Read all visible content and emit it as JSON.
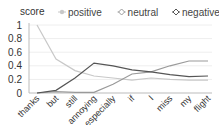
{
  "chart_data": {
    "type": "line",
    "title": "",
    "xlabel": "",
    "ylabel": "score",
    "ylim": [
      0,
      1
    ],
    "yticks": [
      "0",
      "0.2",
      "0.4",
      "0.6",
      "0.8",
      "1"
    ],
    "grid": true,
    "legend_position": "top",
    "categories": [
      "thanks",
      "but",
      "still",
      "annoying",
      "especially",
      "if",
      "I",
      "miss",
      "my",
      "flight"
    ],
    "series": [
      {
        "name": "positive",
        "color": "#c8c8c8",
        "marker": "circle",
        "values": [
          1.0,
          0.5,
          0.33,
          0.25,
          0.22,
          0.19,
          0.22,
          0.2,
          0.19,
          0.19
        ]
      },
      {
        "name": "neutral",
        "color": "#9a9a9a",
        "marker": "diamond",
        "values": [
          0.0,
          0.02,
          0.01,
          0.01,
          0.13,
          0.28,
          0.31,
          0.4,
          0.47,
          0.47
        ]
      },
      {
        "name": "negative",
        "color": "#555555",
        "marker": "diamond",
        "values": [
          0.0,
          0.04,
          0.22,
          0.44,
          0.4,
          0.34,
          0.31,
          0.27,
          0.24,
          0.25
        ]
      }
    ]
  }
}
